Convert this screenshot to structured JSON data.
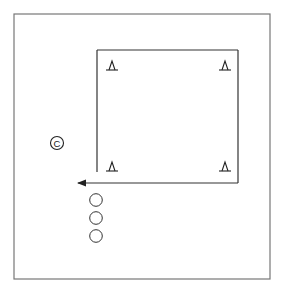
{
  "diagram": {
    "type": "drill-field-diagram",
    "colors": {
      "stroke": "#333333",
      "field_border": "#777777",
      "background": "#ffffff"
    },
    "field": {
      "x": 14,
      "y": 14,
      "width": 256,
      "height": 265
    },
    "square": {
      "left": 97,
      "top": 50,
      "right": 238,
      "bottom": 183,
      "left_side_end_y": 172
    },
    "arrow": {
      "from": [
        238,
        183
      ],
      "to": [
        76,
        183
      ],
      "direction": "left"
    },
    "cones": [
      {
        "name": "cone-top-left",
        "x": 112,
        "y": 66
      },
      {
        "name": "cone-top-right",
        "x": 225,
        "y": 66
      },
      {
        "name": "cone-bottom-left",
        "x": 112,
        "y": 167
      },
      {
        "name": "cone-bottom-right",
        "x": 225,
        "y": 167
      }
    ],
    "coach": {
      "label": "C",
      "x": 57,
      "y": 143
    },
    "players": [
      {
        "x": 96,
        "y": 200
      },
      {
        "x": 96,
        "y": 218
      },
      {
        "x": 96,
        "y": 236
      }
    ]
  }
}
